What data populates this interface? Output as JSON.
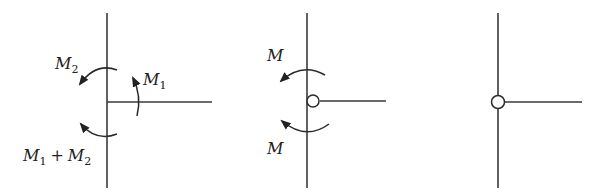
{
  "diagram": {
    "type": "joint moment diagrams",
    "colors": {
      "line": "#3a3a3a",
      "background": "#ffffff"
    },
    "figures": [
      {
        "id": "rigid-joint",
        "labels": {
          "m2": "M",
          "m2_sub": "2",
          "m1": "M",
          "m1_sub": "1",
          "sum_a": "M",
          "sum_a_sub": "1",
          "plus": "+",
          "sum_b": "M",
          "sum_b_sub": "2"
        }
      },
      {
        "id": "hinged-joint-with-moments",
        "labels": {
          "top": "M",
          "bottom": "M"
        }
      },
      {
        "id": "hinged-joint",
        "labels": {}
      }
    ]
  }
}
